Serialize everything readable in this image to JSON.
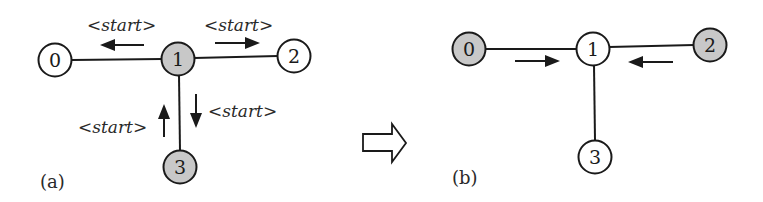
{
  "colors": {
    "stroke": "#1a1a1a",
    "shaded_node": "#c8c8c8",
    "plain_node": "#ffffff"
  },
  "panels": [
    {
      "label": "(a)",
      "nodes": [
        {
          "id": "0",
          "text": "0",
          "cx": 55,
          "cy": 60,
          "shaded": false
        },
        {
          "id": "1",
          "text": "1",
          "cx": 178,
          "cy": 59,
          "shaded": true
        },
        {
          "id": "2",
          "text": "2",
          "cx": 294,
          "cy": 56,
          "shaded": false
        },
        {
          "id": "3",
          "text": "3",
          "cx": 180,
          "cy": 167,
          "shaded": true
        }
      ],
      "edges": [
        [
          "0",
          "1"
        ],
        [
          "1",
          "2"
        ],
        [
          "1",
          "3"
        ]
      ],
      "messages": [
        {
          "text": "<start>",
          "direction": "left",
          "from": "1",
          "to": "0"
        },
        {
          "text": "<start>",
          "direction": "right",
          "from": "1",
          "to": "2"
        },
        {
          "text": "<start>",
          "direction": "down",
          "from": "1",
          "to": "3"
        },
        {
          "text": "<start>",
          "direction": "up",
          "from": "3",
          "to": "1"
        }
      ]
    },
    {
      "label": "(b)",
      "nodes": [
        {
          "id": "0",
          "text": "0",
          "cx": 469,
          "cy": 49,
          "shaded": true
        },
        {
          "id": "1",
          "text": "1",
          "cx": 593,
          "cy": 49,
          "shaded": false
        },
        {
          "id": "2",
          "text": "2",
          "cx": 710,
          "cy": 45,
          "shaded": true
        },
        {
          "id": "3",
          "text": "3",
          "cx": 595,
          "cy": 157,
          "shaded": false
        }
      ],
      "edges": [
        [
          "0",
          "1"
        ],
        [
          "1",
          "2"
        ],
        [
          "1",
          "3"
        ]
      ],
      "messages": [
        {
          "text": "",
          "direction": "right",
          "from": "0",
          "to": "1"
        },
        {
          "text": "",
          "direction": "left",
          "from": "2",
          "to": "1"
        }
      ]
    }
  ],
  "transition": {
    "icon": "hollow-right-arrow-icon",
    "meaning": "transitions to"
  }
}
